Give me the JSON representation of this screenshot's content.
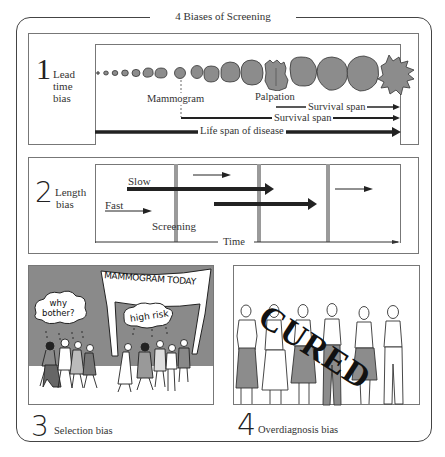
{
  "title": "4 Biases of Screening",
  "colors": {
    "ink": "#222222",
    "tumor_fill": "#8c8c8c",
    "screening_bar": "#9a9a9a",
    "scene_background": "#8a8a8a",
    "frame": "#444444"
  },
  "panels": [
    {
      "number": "1",
      "label_lines": [
        "Lead",
        "time",
        "bias"
      ],
      "annotations": {
        "mammogram": "Mammogram",
        "palpation": "Palpation",
        "survival_span_1": "Survival span",
        "survival_span_2": "Survival span",
        "life_span": "Life span of disease"
      }
    },
    {
      "number": "2",
      "label_lines": [
        "Length",
        "bias"
      ],
      "annotations": {
        "slow": "Slow",
        "fast": "Fast",
        "screening": "Screening",
        "time": "Time"
      }
    },
    {
      "number": "3",
      "label": "Selection bias",
      "illustration": {
        "banner": "MAMMOGRAM TODAY",
        "bubble_left": [
          "why",
          "bother?"
        ],
        "bubble_right": "high risk"
      }
    },
    {
      "number": "4",
      "label": "Overdiagnosis bias",
      "illustration": {
        "stamp": "CURED"
      }
    }
  ]
}
